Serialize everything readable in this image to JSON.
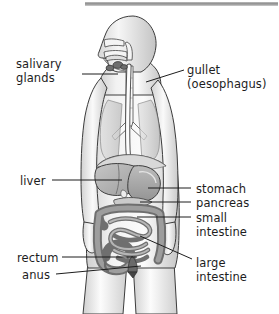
{
  "figure": {
    "type": "anatomical-diagram",
    "background_color": "#ffffff",
    "text_color": "#1d1d1d",
    "leader_line_color": "#1d1d1d",
    "top_bar": {
      "name": "top-gray-bar",
      "color": "#9a9a9a",
      "x": 85,
      "y": 2,
      "width": 194,
      "height": 4
    },
    "body_outline": {
      "stroke": "#3a3a3a",
      "fill_light": "#f4f4f4",
      "fill_shade": "#c9c9c9"
    },
    "organ_colors": {
      "liver": "#b4b4b4",
      "stomach": "#a8a8a8",
      "pancreas": "#bdbdbd",
      "small_intestine": "#9a9a9a",
      "large_intestine": "#8a8a8a",
      "oesophagus": "#e8e8e8",
      "salivary_glands": "#6e6e6e",
      "rectum": "#6a6a6a"
    }
  },
  "labels": {
    "left": [
      {
        "id": "salivary-glands",
        "lines": [
          "salivary",
          "glands"
        ],
        "x": 16,
        "y": 57,
        "leader": {
          "x1": 82,
          "y1": 74,
          "x2": 118,
          "y2": 74
        }
      },
      {
        "id": "liver",
        "lines": [
          "liver"
        ],
        "x": 20,
        "y": 174,
        "leader": {
          "x1": 52,
          "y1": 180,
          "x2": 122,
          "y2": 180
        }
      },
      {
        "id": "rectum",
        "lines": [
          "rectum"
        ],
        "x": 17,
        "y": 251,
        "leader": {
          "x1": 62,
          "y1": 257,
          "x2": 137,
          "y2": 257
        }
      },
      {
        "id": "anus",
        "lines": [
          "anus"
        ],
        "x": 22,
        "y": 268,
        "leader": {
          "x1": 56,
          "y1": 274,
          "x2": 141,
          "y2": 266
        }
      }
    ],
    "right": [
      {
        "id": "gullet-oesophagus",
        "lines": [
          "gullet",
          "(oesophagus)"
        ],
        "x": 187,
        "y": 63,
        "leader": {
          "x1": 184,
          "y1": 70,
          "x2": 146,
          "y2": 82
        }
      },
      {
        "id": "stomach",
        "lines": [
          "stomach"
        ],
        "x": 196,
        "y": 182,
        "leader": {
          "x1": 191,
          "y1": 188,
          "x2": 148,
          "y2": 188
        }
      },
      {
        "id": "pancreas",
        "lines": [
          "pancreas"
        ],
        "x": 196,
        "y": 196,
        "leader": {
          "x1": 191,
          "y1": 202,
          "x2": 140,
          "y2": 202
        }
      },
      {
        "id": "small-intestine",
        "lines": [
          "small",
          "intestine"
        ],
        "x": 196,
        "y": 211,
        "leader": {
          "x1": 191,
          "y1": 217,
          "x2": 137,
          "y2": 217
        }
      },
      {
        "id": "large-intestine",
        "lines": [
          "large",
          "intestine"
        ],
        "x": 196,
        "y": 256,
        "leader": {
          "x1": 192,
          "y1": 259,
          "x2": 140,
          "y2": 236
        }
      }
    ]
  }
}
